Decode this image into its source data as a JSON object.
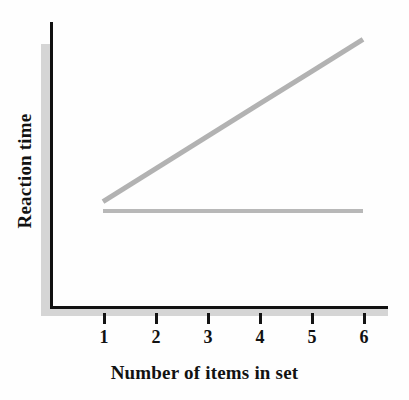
{
  "chart_data": {
    "type": "line",
    "title": "",
    "xlabel": "Number of items in set",
    "ylabel": "Reaction time",
    "x": [
      1,
      2,
      3,
      4,
      5,
      6
    ],
    "categories": [
      "1",
      "2",
      "3",
      "4",
      "5",
      "6"
    ],
    "xlim": [
      1,
      6
    ],
    "ylim": [
      0,
      10
    ],
    "grid": false,
    "legend": "none",
    "y_tick_labels": [],
    "series": [
      {
        "name": "increasing-line",
        "color": "#b2b2b2",
        "values": [
          2.6,
          4.0,
          5.4,
          6.8,
          8.2,
          9.6
        ]
      },
      {
        "name": "flat-line",
        "color": "#b8b8b8",
        "values": [
          2.2,
          2.2,
          2.2,
          2.2,
          2.2,
          2.2
        ]
      }
    ],
    "annotations": []
  },
  "axes": {
    "y_label": "Reaction time",
    "x_label": "Number of items in set",
    "tick_labels": [
      "1",
      "2",
      "3",
      "4",
      "5",
      "6"
    ],
    "axis_color": "#111111",
    "shadow_color": "#d5d5d5"
  },
  "colors": {
    "background": "#fefefe",
    "text": "#121212",
    "series_gray": "#b2b2b2"
  }
}
